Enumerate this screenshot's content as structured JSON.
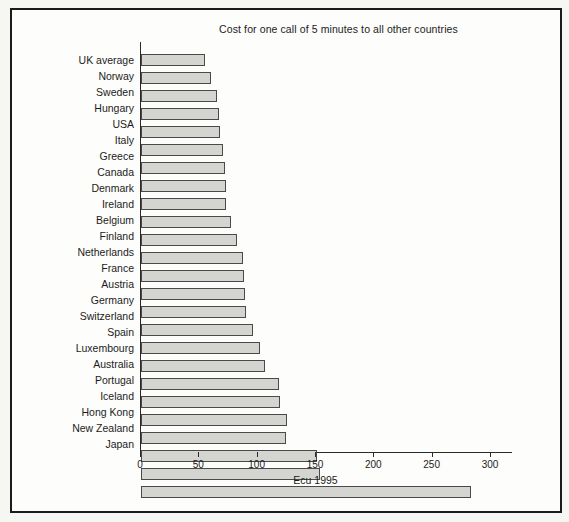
{
  "figure": {
    "frame_color": "#1b1b1b",
    "background_color": "#fdfdfb",
    "page_color": "#f6f6f3"
  },
  "chart_data": {
    "type": "bar",
    "orientation": "horizontal",
    "title": "Cost for one call of 5 minutes to all other countries",
    "xlabel": "Ecu 1995",
    "ylabel": "",
    "xlim": [
      0,
      300
    ],
    "xticks": [
      0,
      50,
      100,
      150,
      200,
      250,
      300
    ],
    "grid": false,
    "legend": "none",
    "bar_color": "#d4d4d1",
    "bar_border_color": "#4a4a4a",
    "categories": [
      "UK average",
      "Norway",
      "Sweden",
      "Hungary",
      "USA",
      "Italy",
      "Greece",
      "Canada",
      "Denmark",
      "Ireland",
      "Belgium",
      "Finland",
      "Netherlands",
      "France",
      "Austria",
      "Germany",
      "Switzerland",
      "Spain",
      "Luxembourg",
      "Australia",
      "Portugal",
      "Iceland",
      "Hong Kong",
      "New Zealand",
      "Japan"
    ],
    "values": [
      55,
      60,
      65,
      67,
      68,
      70,
      72,
      73,
      73,
      77,
      82,
      87,
      88,
      89,
      90,
      96,
      102,
      106,
      118,
      119,
      125,
      124,
      151,
      153,
      283
    ]
  }
}
